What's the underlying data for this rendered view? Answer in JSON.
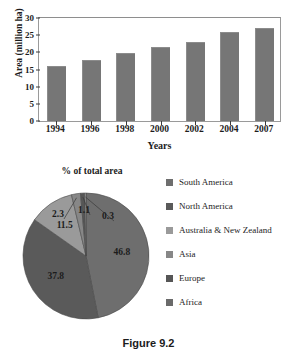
{
  "caption": "Figure 9.2",
  "chart_data": [
    {
      "type": "bar",
      "title": "",
      "xlabel": "Years",
      "ylabel": "Area (million ha)",
      "categories": [
        "1994",
        "1996",
        "1998",
        "2000",
        "2002",
        "2004",
        "2007"
      ],
      "values": [
        15.6,
        17.3,
        19.3,
        21.2,
        22.5,
        25.4,
        26.6
      ],
      "ylim": [
        0,
        30
      ],
      "yticks": [
        0,
        5,
        10,
        15,
        20,
        25,
        30
      ],
      "grid": false,
      "legend": "none",
      "bar_color": "#767676"
    },
    {
      "type": "pie",
      "title": "% of total area",
      "categories": [
        "South America",
        "North America",
        "Australia & New Zealand",
        "Asia",
        "Europe",
        "Africa"
      ],
      "values": [
        46.8,
        37.8,
        11.5,
        2.3,
        1.1,
        0.3
      ],
      "labels": [
        "46.8",
        "37.8",
        "11.5",
        "2.3",
        "1.1",
        "0.3"
      ],
      "colors": [
        "#6e6e6e",
        "#5a5a5a",
        "#9a9a9a",
        "#878787",
        "#565656",
        "#b4b4b4"
      ],
      "legend": "right",
      "legend_entries": [
        {
          "label": "South America",
          "color": "#6e6e6e"
        },
        {
          "label": "North America",
          "color": "#5a5a5a"
        },
        {
          "label": "Australia & New Zealand",
          "color": "#9a9a9a"
        },
        {
          "label": "Asia",
          "color": "#878787"
        },
        {
          "label": "Europe",
          "color": "#565656"
        },
        {
          "label": "Africa",
          "color": "#6a6a6a"
        }
      ]
    }
  ]
}
